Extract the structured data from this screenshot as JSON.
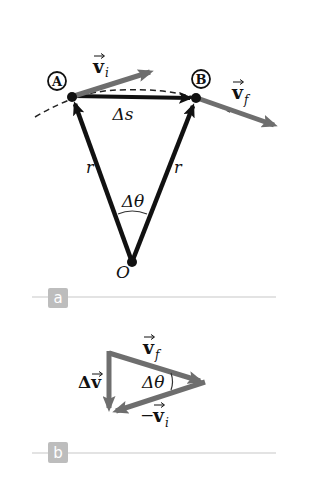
{
  "colors": {
    "black_vector": "#111111",
    "gray_vector": "#6e6e6e",
    "badge_bg": "#bdbdbd",
    "rule_line": "#c8c8c8",
    "dashed_path": "#222222"
  },
  "panel_a": {
    "badge": "a",
    "point_a_label": "A",
    "point_b_label": "B",
    "vi_label": "v",
    "vi_sub": "i",
    "vf_label": "v",
    "vf_sub": "f",
    "ds_label": "Δs",
    "r_left": "r",
    "r_right": "r",
    "dtheta_label": "Δθ",
    "origin_label": "O"
  },
  "panel_b": {
    "badge": "b",
    "vf_label": "v",
    "vf_sub": "f",
    "dv_label": "Δv",
    "dtheta_label": "Δθ",
    "neg_vi_prefix": "−",
    "neg_vi_label": "v",
    "neg_vi_sub": "i"
  }
}
